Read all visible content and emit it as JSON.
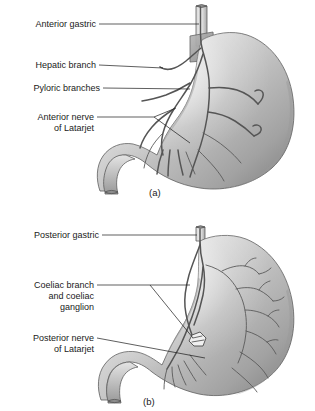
{
  "figure": {
    "background_color": "#ffffff",
    "ink_color": "#1a1a1a",
    "organ_fill_light": "#e8e8e8",
    "organ_fill_mid": "#b4b4b4",
    "organ_fill_dark": "#8f8f8f",
    "nerve_fill": "#d2d2d2",
    "nerve_stroke": "#555555"
  },
  "panels": [
    {
      "id": "panel-a",
      "caption": "(a)",
      "view": "anterior",
      "labels": [
        {
          "id": "anterior-gastric",
          "lines": [
            "Anterior gastric"
          ],
          "text": "Anterior gastric"
        },
        {
          "id": "hepatic-branch",
          "lines": [
            "Hepatic branch"
          ],
          "text": "Hepatic branch"
        },
        {
          "id": "pyloric-branches",
          "lines": [
            "Pyloric branches"
          ],
          "text": "Pyloric branches"
        },
        {
          "id": "anterior-nerve-of-latarjet",
          "lines": [
            "Anterior nerve",
            "of Latarjet"
          ],
          "line1": "Anterior nerve",
          "line2": "of Latarjet"
        }
      ]
    },
    {
      "id": "panel-b",
      "caption": "(b)",
      "view": "posterior",
      "labels": [
        {
          "id": "posterior-gastric",
          "lines": [
            "Posterior gastric"
          ],
          "text": "Posterior gastric"
        },
        {
          "id": "coeliac-branch-and-ganglion",
          "lines": [
            "Coeliac branch",
            "and coeliac",
            "ganglion"
          ],
          "line1": "Coeliac branch",
          "line2": "and coeliac",
          "line3": "ganglion"
        },
        {
          "id": "posterior-nerve-of-latarjet",
          "lines": [
            "Posterior nerve",
            "of Latarjet"
          ],
          "line1": "Posterior nerve",
          "line2": "of Latarjet"
        }
      ]
    }
  ]
}
